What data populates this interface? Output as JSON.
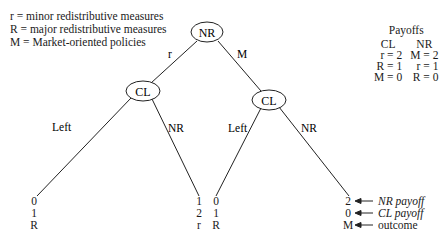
{
  "legend": [
    "r = minor redistributive measures",
    "R = major redistributive measures",
    "M = Market-oriented policies"
  ],
  "tree": {
    "root": {
      "label": "NR"
    },
    "edges_root": {
      "left": "r",
      "right": "M"
    },
    "left_node": {
      "label": "CL",
      "edges": {
        "left": "Left",
        "right": "NR"
      }
    },
    "right_node": {
      "label": "CL",
      "edges": {
        "left": "Left",
        "right": "NR"
      }
    },
    "leaves": [
      {
        "nr": "0",
        "cl": "1",
        "outcome": "R"
      },
      {
        "nr": "1",
        "cl": "2",
        "outcome": "r"
      },
      {
        "nr": "0",
        "cl": "1",
        "outcome": "R"
      },
      {
        "nr": "2",
        "cl": "0",
        "outcome": "M"
      }
    ]
  },
  "key": {
    "nr_payoff": "NR payoff",
    "cl_payoff": "CL payoff",
    "outcome": "outcome"
  },
  "payoffs": {
    "title": "Payoffs",
    "headers": [
      "CL",
      "NR"
    ],
    "rows": [
      [
        "r = 2",
        "M = 2"
      ],
      [
        "R = 1",
        "r = 1"
      ],
      [
        "M = 0",
        "R = 0"
      ]
    ]
  }
}
